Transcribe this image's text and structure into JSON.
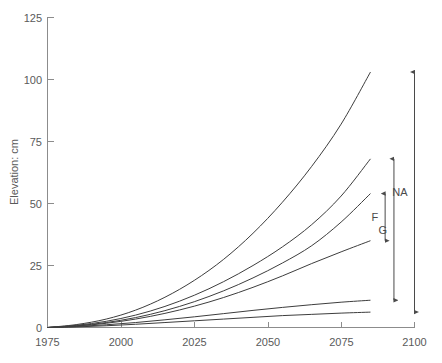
{
  "chart_data": {
    "type": "line",
    "title": "",
    "xlabel": "",
    "ylabel": "Elevation: cm",
    "xlim": [
      1975,
      2100
    ],
    "ylim": [
      0,
      125
    ],
    "grid": false,
    "legend_position": "none",
    "xticks": [
      1975,
      2000,
      2025,
      2050,
      2075,
      2100
    ],
    "yticks": [
      0,
      25,
      50,
      75,
      100,
      125
    ],
    "x": [
      1975,
      1985,
      1995,
      2005,
      2015,
      2025,
      2035,
      2045,
      2055,
      2065,
      2075,
      2085
    ],
    "series": [
      {
        "name": "scenario-1-highest",
        "values": [
          0,
          1.2,
          3.4,
          7.0,
          12.2,
          19.0,
          27.5,
          38.0,
          50.5,
          65.0,
          82.0,
          103.0
        ]
      },
      {
        "name": "scenario-2",
        "values": [
          0,
          0.9,
          2.5,
          5.0,
          8.5,
          13.0,
          18.5,
          25.0,
          32.5,
          41.5,
          53.0,
          68.0
        ]
      },
      {
        "name": "scenario-3",
        "values": [
          0,
          0.7,
          2.0,
          4.0,
          6.8,
          10.4,
          14.8,
          20.0,
          26.0,
          33.0,
          42.5,
          54.0
        ]
      },
      {
        "name": "scenario-4",
        "values": [
          0,
          0.6,
          1.7,
          3.4,
          5.7,
          8.6,
          12.1,
          16.2,
          20.8,
          25.8,
          30.5,
          35.0
        ]
      },
      {
        "name": "scenario-5",
        "values": [
          0,
          0.4,
          1.1,
          2.0,
          3.1,
          4.3,
          5.6,
          6.9,
          8.1,
          9.2,
          10.2,
          11.0
        ]
      },
      {
        "name": "scenario-6-lowest",
        "values": [
          0,
          0.25,
          0.7,
          1.3,
          2.0,
          2.7,
          3.4,
          4.1,
          4.8,
          5.3,
          5.8,
          6.2
        ]
      }
    ],
    "annotations": [
      {
        "label": "NA",
        "x": 2100,
        "y_from": 6.2,
        "y_to": 103.0
      },
      {
        "label": "G",
        "x": 2093,
        "y_from": 11.0,
        "y_to": 68.0
      },
      {
        "label": "F",
        "x": 2090,
        "y_from": 35.0,
        "y_to": 54.0
      }
    ]
  }
}
